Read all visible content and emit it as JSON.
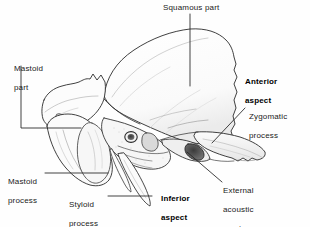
{
  "figure": {
    "background_color": "#fefefe",
    "ink_color": "#2b2b2b",
    "label_color": "#1a1a1a"
  },
  "labels": {
    "squamous_part": "Squamous part",
    "mastoid_part_l1": "Mastoid",
    "mastoid_part_l2": "part",
    "anterior_aspect_l1": "Anterior",
    "anterior_aspect_l2": "aspect",
    "zygomatic_process_l1": "Zygomatic",
    "zygomatic_process_l2": "process",
    "mastoid_process_l1": "Mastoid",
    "mastoid_process_l2": "process",
    "styloid_process_l1": "Styloid",
    "styloid_process_l2": "process",
    "inferior_aspect_l1": "Inferior",
    "inferior_aspect_l2": "aspect",
    "external_acoustic_meatus_l1": "External",
    "external_acoustic_meatus_l2": "acoustic",
    "external_acoustic_meatus_l3": "meatus"
  }
}
